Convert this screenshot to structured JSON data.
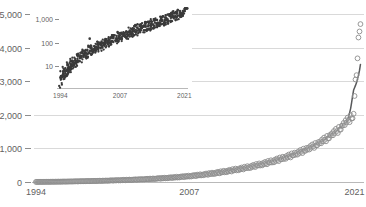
{
  "chart_data": [
    {
      "id": "main",
      "type": "scatter",
      "title": "",
      "subtitle": "",
      "xlabel": "",
      "ylabel": "",
      "xlim": [
        1993.5,
        2021.8
      ],
      "ylim": [
        0,
        5000
      ],
      "yscale": "linear",
      "xscale": "linear",
      "grid": true,
      "grid_axis": "y",
      "grid_color": "#d9d9d9",
      "legend": "none",
      "marker_style": "open-circle",
      "marker_color": "#8c8c8c",
      "trendline": true,
      "trendline_color": "#58595b",
      "xticks": [
        1994,
        2007,
        2021
      ],
      "xtick_labels": [
        "1994",
        "2007",
        "2021"
      ],
      "yticks": [
        0,
        1000,
        2000,
        3000,
        4000,
        5000
      ],
      "ytick_labels": [
        "0",
        "1,000",
        "2,000",
        "3,000",
        "4,000",
        "5,000"
      ],
      "x": [
        1994.0,
        1994.08,
        1994.17,
        1994.25,
        1994.33,
        1994.42,
        1994.5,
        1994.58,
        1994.67,
        1994.75,
        1994.83,
        1994.92,
        1995.0,
        1995.08,
        1995.17,
        1995.25,
        1995.33,
        1995.42,
        1995.5,
        1995.58,
        1995.67,
        1995.75,
        1995.83,
        1995.92,
        1996.0,
        1996.08,
        1996.17,
        1996.25,
        1996.33,
        1996.42,
        1996.5,
        1996.58,
        1996.67,
        1996.75,
        1996.83,
        1996.92,
        1997.0,
        1997.08,
        1997.17,
        1997.25,
        1997.33,
        1997.42,
        1997.5,
        1997.58,
        1997.67,
        1997.75,
        1997.83,
        1997.92,
        1998.0,
        1998.08,
        1998.17,
        1998.25,
        1998.33,
        1998.42,
        1998.5,
        1998.58,
        1998.67,
        1998.75,
        1998.83,
        1998.92,
        1999.0,
        1999.08,
        1999.17,
        1999.25,
        1999.33,
        1999.42,
        1999.5,
        1999.58,
        1999.67,
        1999.75,
        1999.83,
        1999.92,
        2000.0,
        2000.08,
        2000.17,
        2000.25,
        2000.33,
        2000.42,
        2000.5,
        2000.58,
        2000.67,
        2000.75,
        2000.83,
        2000.92,
        2001.0,
        2001.08,
        2001.17,
        2001.25,
        2001.33,
        2001.42,
        2001.5,
        2001.58,
        2001.67,
        2001.75,
        2001.83,
        2001.92,
        2002.0,
        2002.08,
        2002.17,
        2002.25,
        2002.33,
        2002.42,
        2002.5,
        2002.58,
        2002.67,
        2002.75,
        2002.83,
        2002.92,
        2003.0,
        2003.08,
        2003.17,
        2003.25,
        2003.33,
        2003.42,
        2003.5,
        2003.58,
        2003.67,
        2003.75,
        2003.83,
        2003.92,
        2004.0,
        2004.08,
        2004.17,
        2004.25,
        2004.33,
        2004.42,
        2004.5,
        2004.58,
        2004.67,
        2004.75,
        2004.83,
        2004.92,
        2005.0,
        2005.08,
        2005.17,
        2005.25,
        2005.33,
        2005.42,
        2005.5,
        2005.58,
        2005.67,
        2005.75,
        2005.83,
        2005.92,
        2006.0,
        2006.08,
        2006.17,
        2006.25,
        2006.33,
        2006.42,
        2006.5,
        2006.58,
        2006.67,
        2006.75,
        2006.83,
        2006.92,
        2007.0,
        2007.08,
        2007.17,
        2007.25,
        2007.33,
        2007.42,
        2007.5,
        2007.58,
        2007.67,
        2007.75,
        2007.83,
        2007.92,
        2008.0,
        2008.08,
        2008.17,
        2008.25,
        2008.33,
        2008.42,
        2008.5,
        2008.58,
        2008.67,
        2008.75,
        2008.83,
        2008.92,
        2009.0,
        2009.08,
        2009.17,
        2009.25,
        2009.33,
        2009.42,
        2009.5,
        2009.58,
        2009.67,
        2009.75,
        2009.83,
        2009.92,
        2010.0,
        2010.08,
        2010.17,
        2010.25,
        2010.33,
        2010.42,
        2010.5,
        2010.58,
        2010.67,
        2010.75,
        2010.83,
        2010.92,
        2011.0,
        2011.08,
        2011.17,
        2011.25,
        2011.33,
        2011.42,
        2011.5,
        2011.58,
        2011.67,
        2011.75,
        2011.83,
        2011.92,
        2012.0,
        2012.08,
        2012.17,
        2012.25,
        2012.33,
        2012.42,
        2012.5,
        2012.58,
        2012.67,
        2012.75,
        2012.83,
        2012.92,
        2013.0,
        2013.08,
        2013.17,
        2013.25,
        2013.33,
        2013.42,
        2013.5,
        2013.58,
        2013.67,
        2013.75,
        2013.83,
        2013.92,
        2014.0,
        2014.08,
        2014.17,
        2014.25,
        2014.33,
        2014.42,
        2014.5,
        2014.58,
        2014.67,
        2014.75,
        2014.83,
        2014.92,
        2015.0,
        2015.08,
        2015.17,
        2015.25,
        2015.33,
        2015.42,
        2015.5,
        2015.58,
        2015.67,
        2015.75,
        2015.83,
        2015.92,
        2016.0,
        2016.08,
        2016.17,
        2016.25,
        2016.33,
        2016.42,
        2016.5,
        2016.58,
        2016.67,
        2016.75,
        2016.83,
        2016.92,
        2017.0,
        2017.08,
        2017.17,
        2017.25,
        2017.33,
        2017.42,
        2017.5,
        2017.58,
        2017.67,
        2017.75,
        2017.83,
        2017.92,
        2018.0,
        2018.08,
        2018.17,
        2018.25,
        2018.33,
        2018.42,
        2018.5,
        2018.58,
        2018.67,
        2018.75,
        2018.83,
        2018.92,
        2019.0,
        2019.08,
        2019.17,
        2019.25,
        2019.33,
        2019.42,
        2019.5,
        2019.58,
        2019.67,
        2019.75,
        2019.83,
        2019.92,
        2020.0,
        2020.08,
        2020.17,
        2020.25,
        2020.33,
        2020.42,
        2020.5,
        2020.58,
        2020.67,
        2020.75,
        2020.83,
        2020.92,
        2021.0,
        2021.08,
        2021.17,
        2021.25,
        2021.33,
        2021.42,
        2021.5
      ],
      "y": [
        2,
        3,
        2,
        4,
        3,
        5,
        4,
        3,
        6,
        4,
        5,
        7,
        5,
        6,
        4,
        8,
        6,
        9,
        7,
        6,
        10,
        8,
        9,
        12,
        8,
        11,
        9,
        14,
        11,
        15,
        12,
        10,
        16,
        13,
        14,
        18,
        14,
        17,
        15,
        20,
        17,
        22,
        19,
        16,
        24,
        20,
        21,
        26,
        20,
        24,
        21,
        28,
        24,
        30,
        26,
        22,
        32,
        27,
        28,
        35,
        27,
        32,
        28,
        37,
        32,
        40,
        34,
        30,
        42,
        36,
        37,
        45,
        36,
        42,
        37,
        48,
        42,
        52,
        45,
        40,
        55,
        47,
        48,
        58,
        46,
        53,
        48,
        60,
        53,
        65,
        57,
        51,
        68,
        59,
        60,
        72,
        58,
        66,
        60,
        74,
        66,
        80,
        71,
        64,
        84,
        73,
        74,
        88,
        72,
        81,
        74,
        90,
        81,
        97,
        87,
        79,
        102,
        89,
        90,
        106,
        88,
        99,
        91,
        110,
        99,
        118,
        106,
        97,
        124,
        109,
        110,
        129,
        108,
        121,
        111,
        133,
        120,
        143,
        129,
        118,
        150,
        133,
        134,
        157,
        131,
        147,
        135,
        161,
        146,
        173,
        157,
        144,
        182,
        162,
        163,
        190,
        160,
        178,
        164,
        195,
        177,
        209,
        190,
        175,
        220,
        197,
        198,
        230,
        195,
        216,
        199,
        236,
        215,
        252,
        230,
        213,
        266,
        239,
        240,
        278,
        237,
        261,
        241,
        284,
        260,
        303,
        278,
        258,
        320,
        289,
        290,
        334,
        287,
        315,
        291,
        341,
        314,
        363,
        335,
        312,
        383,
        348,
        349,
        399,
        345,
        376,
        349,
        406,
        376,
        431,
        400,
        374,
        454,
        415,
        416,
        471,
        412,
        447,
        416,
        480,
        447,
        509,
        474,
        445,
        535,
        491,
        492,
        553,
        490,
        528,
        494,
        565,
        529,
        597,
        559,
        527,
        626,
        578,
        579,
        647,
        580,
        622,
        585,
        664,
        625,
        699,
        657,
        622,
        730,
        678,
        679,
        752,
        685,
        731,
        691,
        778,
        735,
        816,
        769,
        731,
        851,
        793,
        794,
        873,
        810,
        861,
        816,
        911,
        864,
        953,
        901,
        860,
        991,
        928,
        929,
        1015,
        960,
        1016,
        967,
        1071,
        1019,
        1117,
        1060,
        1015,
        1160,
        1091,
        1092,
        1186,
        1145,
        1207,
        1153,
        1267,
        1211,
        1322,
        1259,
        1210,
        1372,
        1297,
        1298,
        1402,
        1380,
        1450,
        1390,
        1518,
        1456,
        1582,
        1513,
        1458,
        1640,
        1558,
        1560,
        1676,
        1680,
        1760,
        1694,
        1840,
        1772,
        1918,
        1840,
        1780,
        1986,
        1894,
        1896,
        2030,
        2560,
        3050,
        3180,
        3680,
        4300,
        4480,
        4700
      ]
    },
    {
      "id": "inset",
      "type": "scatter",
      "title": "",
      "xlabel": "",
      "ylabel": "",
      "xlim": [
        1993.5,
        2021.8
      ],
      "ylim": [
        1.2,
        3000
      ],
      "yscale": "log",
      "xscale": "linear",
      "grid": false,
      "legend": "none",
      "marker_style": "filled-dot",
      "marker_color": "#3a3a3a",
      "trendline": false,
      "xticks": [
        1994,
        2007,
        2021
      ],
      "xtick_labels": [
        "1994",
        "2007",
        "2021"
      ],
      "yticks": [
        10,
        100,
        1000
      ],
      "ytick_labels": [
        "10",
        "100",
        "1,000"
      ],
      "note": "same underlying series as main panel, plotted on a logarithmic y-axis; approximately linear indicating constant exponential growth rate"
    }
  ],
  "main_axis": {
    "ytick_labels": [
      "5,000",
      "4,000",
      "3,000",
      "2,000",
      "1,000",
      "0"
    ],
    "xtick_labels": [
      "1994",
      "2007",
      "2021"
    ]
  },
  "inset_axis": {
    "ytick_labels": [
      "1,000",
      "100",
      "10"
    ],
    "xtick_labels": [
      "1994",
      "2007",
      "2021"
    ]
  },
  "colors": {
    "background": "#ffffff",
    "gridline": "#d9d9d9",
    "axis": "#b9b9b9",
    "tick_text": "#5f5f5f",
    "marker_outline": "#8c8c8c",
    "trendline": "#58595b",
    "inset_marker": "#3a3a3a"
  }
}
